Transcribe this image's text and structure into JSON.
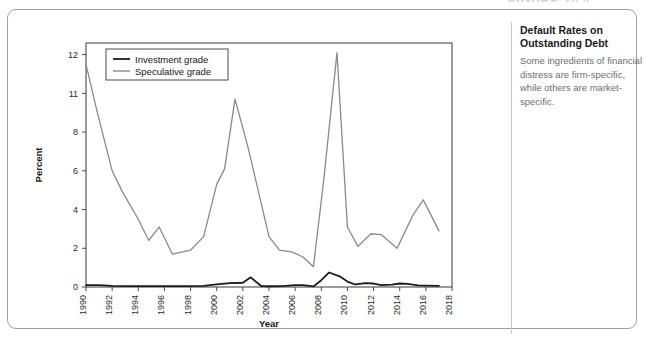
{
  "figure_heading": "FIGURE 20.4",
  "caption": {
    "title_line_1": "Default Rates on",
    "title_line_2": "Outstanding Debt",
    "body": "Some ingredients of financial distress are firm-specific, while others are market-specific."
  },
  "chart_data": {
    "type": "line",
    "title": "",
    "xlabel": "Year",
    "ylabel": "Percent",
    "xlim": [
      1990,
      2018
    ],
    "ylim": [
      0,
      12.6
    ],
    "grid": false,
    "legend_position": "top-left",
    "x_tick_labels": [
      "1990",
      "1992",
      "1994",
      "1996",
      "1998",
      "2000",
      "2002",
      "2004",
      "2006",
      "2008",
      "2010",
      "2012",
      "2014",
      "2016",
      "2018"
    ],
    "x_ticks": [
      1990,
      1992,
      1994,
      1996,
      1998,
      2000,
      2002,
      2004,
      2006,
      2008,
      2010,
      2012,
      2014,
      2016,
      2018
    ],
    "y_tick_labels": [
      "0",
      "2",
      "4",
      "6",
      "8",
      "11",
      "12"
    ],
    "y_ticks": [
      0,
      2,
      4,
      6,
      8,
      10,
      12
    ],
    "x": [
      1990,
      1991,
      1992,
      1993,
      1994,
      1995,
      1996,
      1997,
      1998,
      1999,
      2000,
      2001,
      2002,
      2003,
      2004,
      2005,
      2006,
      2007,
      2008,
      2009,
      2010,
      2011,
      2012,
      2013,
      2014,
      2015,
      2016,
      2017
    ],
    "series": [
      {
        "name": "Investment grade",
        "color": "#1c1c1c",
        "width": 1.7,
        "values": [
          0.08,
          0.1,
          0.07,
          0.05,
          0.05,
          0.05,
          0.05,
          0.05,
          0.05,
          0.06,
          0.15,
          0.22,
          0.5,
          0.05,
          0.04,
          0.08,
          0.08,
          0.05,
          0.45,
          0.75,
          0.15,
          0.17,
          0.2,
          0.1,
          0.18,
          0.12,
          0.1,
          0.06
        ]
      },
      {
        "name": "Speculative grade",
        "color": "#8a8a8a",
        "width": 1.3,
        "values": [
          11.5,
          9.2,
          6.0,
          4.9,
          3.5,
          2.4,
          3.1,
          1.7,
          1.8,
          1.9,
          3.0,
          5.3,
          6.1,
          9.7,
          7.5,
          5.0,
          2.6,
          1.9,
          1.8,
          1.55,
          1.05,
          6.0,
          12.1,
          3.1,
          2.1,
          2.75,
          2.8,
          2.6
        ]
      }
    ],
    "series_plotted": [
      {
        "name": "Investment grade",
        "color": "#1c1c1c",
        "width": 1.8,
        "points": [
          [
            1990,
            0.1
          ],
          [
            1991,
            0.1
          ],
          [
            1992,
            0.06
          ],
          [
            1993,
            0.05
          ],
          [
            1994,
            0.05
          ],
          [
            1995,
            0.05
          ],
          [
            1996,
            0.05
          ],
          [
            1997,
            0.05
          ],
          [
            1998,
            0.05
          ],
          [
            1999,
            0.06
          ],
          [
            2000,
            0.14
          ],
          [
            2001,
            0.2
          ],
          [
            2002,
            0.22
          ],
          [
            2002.6,
            0.5
          ],
          [
            2003.4,
            0.05
          ],
          [
            2004,
            0.04
          ],
          [
            2005,
            0.05
          ],
          [
            2006,
            0.1
          ],
          [
            2006.6,
            0.1
          ],
          [
            2007.4,
            0.03
          ],
          [
            2008,
            0.35
          ],
          [
            2008.6,
            0.75
          ],
          [
            2009.4,
            0.55
          ],
          [
            2010,
            0.28
          ],
          [
            2010.6,
            0.13
          ],
          [
            2011.4,
            0.2
          ],
          [
            2012,
            0.18
          ],
          [
            2012.6,
            0.1
          ],
          [
            2013.4,
            0.12
          ],
          [
            2014,
            0.18
          ],
          [
            2014.6,
            0.16
          ],
          [
            2015.4,
            0.08
          ],
          [
            2016,
            0.07
          ],
          [
            2017,
            0.06
          ]
        ]
      },
      {
        "name": "Speculative grade",
        "color": "#8a8a8a",
        "width": 1.3,
        "points": [
          [
            1990,
            11.5
          ],
          [
            1990.8,
            9.2
          ],
          [
            1992,
            6.0
          ],
          [
            1992.8,
            4.9
          ],
          [
            1994,
            3.5
          ],
          [
            1994.8,
            2.4
          ],
          [
            1995.6,
            3.1
          ],
          [
            1996.6,
            1.7
          ],
          [
            1998,
            1.9
          ],
          [
            1999,
            2.6
          ],
          [
            2000,
            5.3
          ],
          [
            2000.6,
            6.1
          ],
          [
            2001.4,
            9.7
          ],
          [
            2002.4,
            7.2
          ],
          [
            2004,
            2.6
          ],
          [
            2004.8,
            1.9
          ],
          [
            2005.8,
            1.8
          ],
          [
            2006.6,
            1.55
          ],
          [
            2007.4,
            1.05
          ],
          [
            2008.2,
            5.6
          ],
          [
            2009.2,
            12.1
          ],
          [
            2010,
            3.1
          ],
          [
            2010.8,
            2.1
          ],
          [
            2011.8,
            2.75
          ],
          [
            2012.6,
            2.7
          ],
          [
            2013.8,
            2.0
          ],
          [
            2015,
            3.7
          ],
          [
            2015.8,
            4.5
          ],
          [
            2017,
            2.9
          ]
        ]
      }
    ],
    "annotations": []
  }
}
